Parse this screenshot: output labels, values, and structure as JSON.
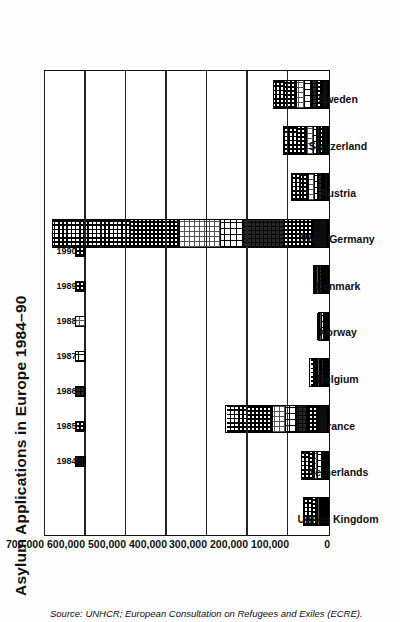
{
  "chart_data": {
    "type": "bar",
    "subtype": "stacked-bar",
    "orientation": "vertical",
    "title": "Asylum Applications in Europe 1984–90",
    "xlabel": "",
    "ylabel": "",
    "ylim": [
      0,
      700000
    ],
    "yticks": [
      0,
      100000,
      200000,
      300000,
      400000,
      500000,
      600000,
      700000
    ],
    "ytick_labels": [
      "0",
      "100,000",
      "200,000",
      "300,000",
      "400,000",
      "500,000",
      "600,000",
      "700,000"
    ],
    "grid": true,
    "legend_position": "top-left-inside",
    "categories": [
      "United Kingdom",
      "Netherlands",
      "France",
      "Belgium",
      "Norway",
      "Denmark",
      "West Germany",
      "Austria",
      "Switzerland",
      "Sweden"
    ],
    "series": [
      {
        "name": "1984",
        "pattern": "solid-black",
        "values": [
          4000,
          2600,
          22000,
          3700,
          300,
          4300,
          35000,
          7200,
          7400,
          12000
        ]
      },
      {
        "name": "1985",
        "pattern": "coarse-checker",
        "values": [
          6200,
          5600,
          29000,
          5300,
          800,
          8700,
          73000,
          6700,
          9700,
          14500
        ]
      },
      {
        "name": "1986",
        "pattern": "dark-dotted",
        "values": [
          5700,
          5900,
          26000,
          7600,
          2700,
          9300,
          100000,
          8600,
          8500,
          14600
        ]
      },
      {
        "name": "1987",
        "pattern": "open-grid",
        "values": [
          5900,
          13500,
          27700,
          6000,
          8600,
          2700,
          57000,
          11400,
          10900,
          18100
        ]
      },
      {
        "name": "1988",
        "pattern": "light-stipple",
        "values": [
          5700,
          7500,
          34300,
          4500,
          6600,
          4700,
          103000,
          15800,
          16700,
          19600
        ]
      },
      {
        "name": "1989",
        "pattern": "medium-checker",
        "values": [
          11600,
          13900,
          61400,
          8100,
          4400,
          4600,
          121000,
          21900,
          24400,
          30000
        ]
      },
      {
        "name": "1990",
        "pattern": "fine-grid",
        "values": [
          25000,
          21200,
          54800,
          13000,
          4000,
          5300,
          193000,
          22800,
          35800,
          29400
        ]
      }
    ],
    "totals": [
      64100,
      70200,
      255200,
      48200,
      27400,
      39600,
      682000,
      94400,
      113400,
      138200
    ],
    "source_note": "Source: UNHCR; European Consultation on Refugees and Exiles (ECRE)."
  },
  "colors": {
    "axis": "#111111",
    "grid": "#222222",
    "plot_background": "#ffffff",
    "page_background": "#fdfdfd",
    "text": "#111111"
  }
}
